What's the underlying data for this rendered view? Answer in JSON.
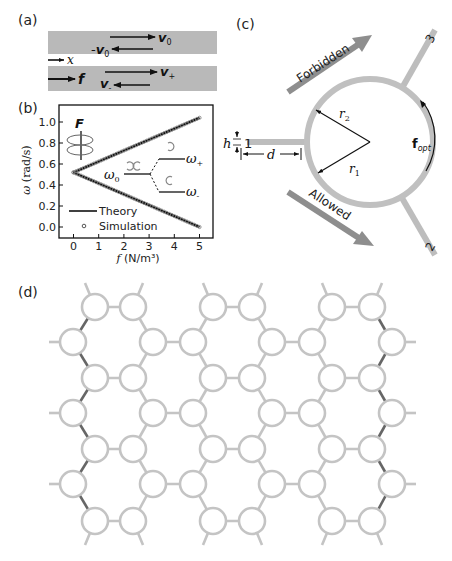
{
  "figure": {
    "colors": {
      "waveguide": "#b7b7b7",
      "ring": "#c4c4c4",
      "ring_highlight": "#555555",
      "arrow_band": "#8e8e8e",
      "ink": "#111111"
    },
    "panel_a": {
      "label": "(a)",
      "upper_bar": {
        "forward": "v0",
        "backward": "-v0"
      },
      "axis_label": "x",
      "lower_bar": {
        "force": "f",
        "forward": "v+",
        "backward": "v-"
      },
      "text": {
        "v0_forward": "v",
        "v0_forward_sub": "0",
        "v0_back_prefix": "-",
        "v0_back": "v",
        "v0_back_sub": "0",
        "x": "x",
        "f": "f",
        "vplus": "v",
        "vplus_sub": "+",
        "vminus": "v",
        "vminus_sub": "-"
      }
    },
    "panel_b": {
      "label": "(b)",
      "inset": {
        "force_label": "F",
        "omega0": "ω",
        "omega0_sub": "0",
        "omega_plus": "ω",
        "omega_plus_sub": "+",
        "omega_minus": "ω",
        "omega_minus_sub": "-"
      },
      "legend": {
        "theory": "Theory",
        "simulation": "Simulation"
      }
    },
    "panel_c": {
      "label": "(c)",
      "forbidden": "Forbidden",
      "allowed": "Allowed",
      "ports": [
        "1",
        "2",
        "3"
      ],
      "dims": {
        "h": "h",
        "d": "d",
        "r1": "r",
        "r1_sub": "1",
        "r2": "r",
        "r2_sub": "2"
      },
      "force": {
        "symbol": "f",
        "sub": "opt"
      }
    },
    "panel_d": {
      "label": "(d)",
      "lattice": {
        "row_y": [
          307,
          342,
          378,
          413,
          449,
          484,
          521
        ],
        "rowA_x": [
          95,
          133,
          213,
          252,
          332,
          372
        ],
        "rowB_x": [
          73,
          153,
          193,
          272,
          312,
          392
        ],
        "ring_radius": 13
      }
    }
  },
  "chart_data": {
    "type": "line",
    "title": "",
    "xlabel": "f (N/m³)",
    "ylabel": "ω (rad/s)",
    "xlim": [
      -0.6,
      5.4
    ],
    "ylim": [
      -0.1,
      1.12
    ],
    "xticks": [
      0,
      1,
      2,
      3,
      4,
      5
    ],
    "yticks": [
      0.0,
      0.2,
      0.4,
      0.6,
      0.8,
      1.0
    ],
    "ytick_labels": [
      "0.0",
      "0.2",
      "0.4",
      "0.6",
      "0.8",
      "1.0"
    ],
    "grid": false,
    "legend": [
      "Theory",
      "Simulation"
    ],
    "legend_position": "lower left",
    "series": [
      {
        "name": "Theory ω+",
        "x": [
          0,
          5
        ],
        "y": [
          0.52,
          1.04
        ]
      },
      {
        "name": "Theory ω-",
        "x": [
          0,
          5
        ],
        "y": [
          0.52,
          0.0
        ]
      },
      {
        "name": "Simulation ω+",
        "x": [
          0,
          0.5,
          1,
          1.5,
          2,
          2.5,
          3,
          3.5,
          4,
          4.5,
          5
        ],
        "y": [
          0.52,
          0.572,
          0.624,
          0.676,
          0.728,
          0.78,
          0.832,
          0.884,
          0.936,
          0.988,
          1.04
        ]
      },
      {
        "name": "Simulation ω-",
        "x": [
          0,
          0.5,
          1,
          1.5,
          2,
          2.5,
          3,
          3.5,
          4,
          4.5,
          5
        ],
        "y": [
          0.52,
          0.468,
          0.416,
          0.364,
          0.312,
          0.26,
          0.208,
          0.156,
          0.104,
          0.052,
          0.0
        ]
      }
    ],
    "annotations": [
      "ω0",
      "ω+",
      "ω-",
      "F"
    ]
  }
}
